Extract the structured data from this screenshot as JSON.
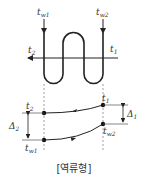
{
  "diagram": {
    "type": "counterflow-heat-exchanger",
    "caption": "[역류형]",
    "labels": {
      "tw1": {
        "base": "t",
        "sub": "w1"
      },
      "tw2": {
        "base": "t",
        "sub": "w2"
      },
      "t1_top": {
        "base": "t",
        "sub": "1"
      },
      "t2_top": {
        "base": "t",
        "sub": "2"
      },
      "t1": {
        "base": "t",
        "sub": "1"
      },
      "t2": {
        "base": "t",
        "sub": "2"
      },
      "tw1_bottom": {
        "base": "t",
        "sub": "w1"
      },
      "tw2_bottom": {
        "base": "t",
        "sub": "w2"
      },
      "delta1": {
        "base": "Δ",
        "sub": "1"
      },
      "delta2": {
        "base": "Δ",
        "sub": "2"
      }
    },
    "colors": {
      "line": "#222222",
      "dash": "#888888",
      "text": "#333333"
    }
  }
}
